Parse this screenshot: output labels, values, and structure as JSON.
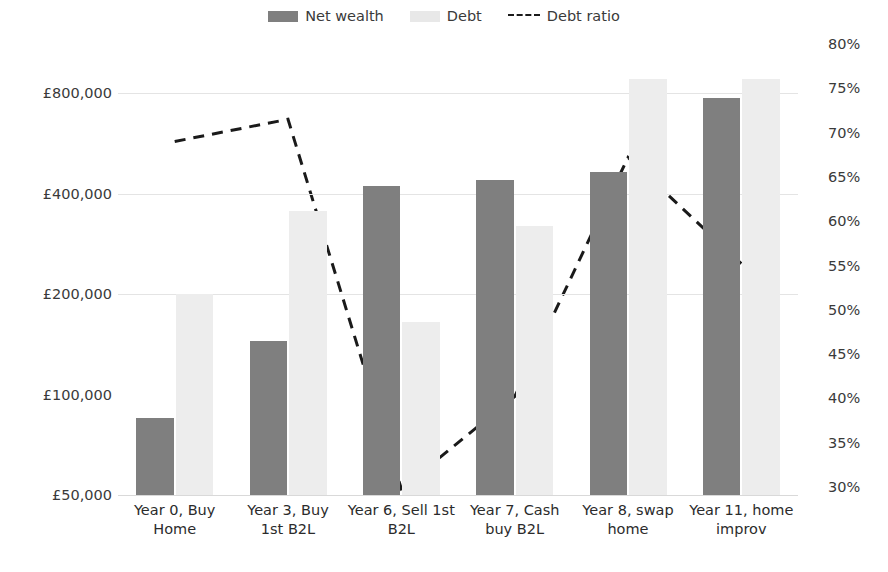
{
  "legend": {
    "items": [
      {
        "label": "Net wealth",
        "kind": "swatch",
        "color": "#7f7f7f",
        "icon": "net-wealth-swatch"
      },
      {
        "label": "Debt",
        "kind": "swatch",
        "color": "#e8e8e8",
        "icon": "debt-swatch"
      },
      {
        "label": "Debt ratio",
        "kind": "dashed-line",
        "color": "#1a1a1a",
        "icon": "debt-ratio-line"
      }
    ]
  },
  "caption": "",
  "chart_data": {
    "type": "bar",
    "title": "",
    "xlabel": "",
    "ylabel": "",
    "categories": [
      "Year 0, Buy Home",
      "Year 3, Buy 1st B2L",
      "Year 6, Sell 1st B2L",
      "Year 7, Cash buy B2L",
      "Year 8, swap home",
      "Year 11, home improv"
    ],
    "category_lines": [
      [
        "Year 0, Buy",
        "Home"
      ],
      [
        "Year 3, Buy",
        "1st B2L"
      ],
      [
        "Year 6, Sell 1st",
        "B2L"
      ],
      [
        "Year 7, Cash",
        "buy B2L"
      ],
      [
        "Year 8, swap",
        "home"
      ],
      [
        "Year 11, home",
        "improv"
      ]
    ],
    "series": [
      {
        "name": "Net wealth",
        "type": "bar",
        "axis": "left",
        "color": "#7f7f7f",
        "values": [
          85000,
          145000,
          420000,
          440000,
          465000,
          775000
        ]
      },
      {
        "name": "Debt",
        "type": "bar",
        "axis": "left",
        "color": "#ededed",
        "values": [
          200000,
          355000,
          165000,
          320000,
          880000,
          880000
        ]
      },
      {
        "name": "Debt ratio",
        "type": "line",
        "axis": "right",
        "color": "#1a1a1a",
        "style": "dashed",
        "values": [
          69,
          71.5,
          29.8,
          40.2,
          67.2,
          55.2
        ]
      }
    ],
    "y_left": {
      "scale": "log",
      "ticks": [
        50000,
        100000,
        200000,
        400000,
        800000
      ],
      "tick_labels": [
        "£50,000",
        "£100,000",
        "£200,000",
        "£400,000",
        "£800,000"
      ],
      "min": 50000,
      "max": 1000000
    },
    "y_right": {
      "scale": "linear",
      "ticks": [
        30,
        35,
        40,
        45,
        50,
        55,
        60,
        65,
        70,
        75,
        80
      ],
      "tick_labels": [
        "30%",
        "35%",
        "40%",
        "45%",
        "50%",
        "55%",
        "60%",
        "65%",
        "70%",
        "75%",
        "80%"
      ],
      "min": 30,
      "max": 80
    },
    "grid": true,
    "gridlines_left": [
      200000,
      400000,
      800000
    ],
    "legend_position": "top-center"
  }
}
